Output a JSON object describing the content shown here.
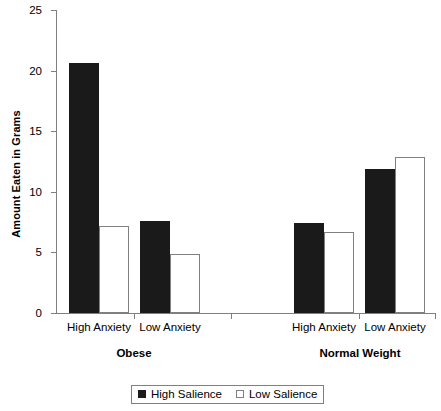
{
  "chart_data": {
    "type": "bar",
    "title": "",
    "xlabel": "",
    "ylabel": "Amount Eaten in Grams",
    "ylim": [
      0,
      25
    ],
    "yticks": [
      0,
      5,
      10,
      15,
      20,
      25
    ],
    "grid": false,
    "legend_position": "bottom",
    "groups": [
      "Obese",
      "Normal Weight"
    ],
    "categories": [
      "High Anxiety",
      "Low Anxiety",
      "High Anxiety",
      "Low Anxiety"
    ],
    "series": [
      {
        "name": "High Salience",
        "color": "#1a1a1a",
        "values": [
          20.6,
          7.6,
          7.4,
          11.9
        ]
      },
      {
        "name": "Low Salience",
        "color": "#ffffff",
        "values": [
          7.2,
          4.9,
          6.7,
          12.9
        ]
      }
    ],
    "bars": [
      {
        "group": "Obese",
        "category": "High Anxiety",
        "series": "High Salience",
        "value": 20.6
      },
      {
        "group": "Obese",
        "category": "High Anxiety",
        "series": "Low Salience",
        "value": 7.2
      },
      {
        "group": "Obese",
        "category": "Low Anxiety",
        "series": "High Salience",
        "value": 7.6
      },
      {
        "group": "Obese",
        "category": "Low Anxiety",
        "series": "Low Salience",
        "value": 4.9
      },
      {
        "group": "Normal Weight",
        "category": "High Anxiety",
        "series": "High Salience",
        "value": 7.4
      },
      {
        "group": "Normal Weight",
        "category": "High Anxiety",
        "series": "Low Salience",
        "value": 6.7
      },
      {
        "group": "Normal Weight",
        "category": "Low Anxiety",
        "series": "High Salience",
        "value": 11.9
      },
      {
        "group": "Normal Weight",
        "category": "Low Anxiety",
        "series": "Low Salience",
        "value": 12.9
      }
    ]
  },
  "axis": {
    "ytick_labels": [
      "0",
      "5",
      "10",
      "15",
      "20",
      "25"
    ],
    "y_title": "Amount Eaten in Grams"
  },
  "categories": {
    "c0": "High Anxiety",
    "c1": "Low Anxiety",
    "c2": "High Anxiety",
    "c3": "Low Anxiety"
  },
  "groups": {
    "g0": "Obese",
    "g1": "Normal Weight"
  },
  "legend": {
    "items": [
      {
        "label": "High Salience",
        "style": "filled"
      },
      {
        "label": "Low Salience",
        "style": "open"
      }
    ],
    "item0": "High Salience",
    "item1": "Low Salience"
  }
}
